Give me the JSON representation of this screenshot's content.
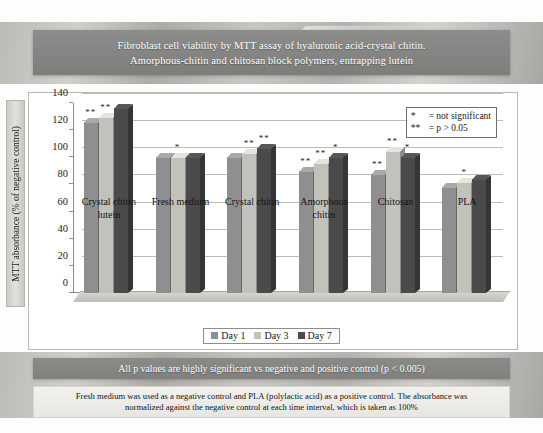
{
  "title": {
    "line1": "Fibroblast cell viability by MTT assay of hyaluronic acid-crystal chitin.",
    "line2": "Amorphous-chitin and chitosan block polymers, entrapping lutein"
  },
  "stat_legend": {
    "rows": [
      {
        "symbol": "*",
        "text": "= not significant"
      },
      {
        "symbol": "**",
        "text": "= p > 0.05"
      }
    ]
  },
  "footer": {
    "banner": "All p values are highly significant vs negative and positive control (p < 0.005)",
    "note_line1": "Fresh medium was used as a negative control and PLA (polylactic acid) as a positive control. The absorbance was",
    "note_line2": "normalized against the negative control at each time interval, which is taken as 100%"
  },
  "colors": {
    "day1": "#8f8f8f",
    "day3": "#c2c2bd",
    "day7": "#4a4a4a",
    "banner": "#858583",
    "panel_border": "#b8b8b4",
    "gridline": "#c2c2bd"
  },
  "chart_data": {
    "type": "bar",
    "title": "Fibroblast cell viability by MTT assay of hyaluronic acid-crystal chitin. Amorphous-chitin and chitosan block polymers, entrapping lutein",
    "xlabel": "",
    "ylabel": "MTT absorbance (% of negative control)",
    "ylim": [
      0,
      140
    ],
    "yticks": [
      0,
      20,
      40,
      60,
      80,
      100,
      120,
      140
    ],
    "grid": true,
    "legend_position": "bottom",
    "categories": [
      "Crystal chitin lutein",
      "Fresh medium",
      "Crystal chitin",
      "Amorphous chitin",
      "Chitosan",
      "PLA"
    ],
    "category_lines": [
      [
        "Crystal chitin",
        "lutein"
      ],
      [
        "Fresh medium",
        ""
      ],
      [
        "Crystal chitin",
        ""
      ],
      [
        "Amorphous",
        "chitin"
      ],
      [
        "Chitosan",
        ""
      ],
      [
        "PLA",
        ""
      ]
    ],
    "series": [
      {
        "name": "Day 1",
        "color": "#8f8f8f",
        "values": [
          126,
          100,
          100,
          90,
          88,
          78
        ]
      },
      {
        "name": "Day 3",
        "color": "#c2c2bd",
        "values": [
          130,
          100,
          103,
          96,
          105,
          82
        ]
      },
      {
        "name": "Day 7",
        "color": "#4a4a4a",
        "values": [
          136,
          100,
          107,
          100,
          100,
          84
        ]
      }
    ],
    "significance_marks": [
      {
        "category": 0,
        "series": 0,
        "mark": "**"
      },
      {
        "category": 0,
        "series": 1,
        "mark": "**"
      },
      {
        "category": 1,
        "series": 1,
        "mark": "*"
      },
      {
        "category": 2,
        "series": 1,
        "mark": "**"
      },
      {
        "category": 2,
        "series": 2,
        "mark": "**"
      },
      {
        "category": 3,
        "series": 0,
        "mark": "**"
      },
      {
        "category": 3,
        "series": 1,
        "mark": "**"
      },
      {
        "category": 3,
        "series": 2,
        "mark": "*"
      },
      {
        "category": 4,
        "series": 0,
        "mark": "**"
      },
      {
        "category": 4,
        "series": 1,
        "mark": "**"
      },
      {
        "category": 4,
        "series": 2,
        "mark": "*"
      },
      {
        "category": 5,
        "series": 1,
        "mark": "*"
      }
    ]
  }
}
